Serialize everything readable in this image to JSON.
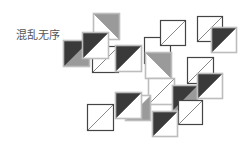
{
  "label": "混乱无序",
  "colors": {
    "dark": "#3a3a3a",
    "gray": "#9a9a9a",
    "outline": "#444444",
    "border_light": "#bdbdbd",
    "bg": "#ffffff"
  },
  "tiles": [
    {
      "x": 93,
      "y": 13,
      "s": 27,
      "fill": "gray",
      "tri": "tr",
      "line": "tlbr",
      "border": "light"
    },
    {
      "x": 144,
      "y": 37,
      "s": 27,
      "fill": "none",
      "tri": "none",
      "line": "none",
      "border": "dark"
    },
    {
      "x": 160,
      "y": 20,
      "s": 26,
      "fill": "none",
      "tri": "none",
      "line": "bltr",
      "border": "dark"
    },
    {
      "x": 197,
      "y": 16,
      "s": 26,
      "fill": "none",
      "tri": "none",
      "line": "bltr",
      "border": "dark"
    },
    {
      "x": 63,
      "y": 40,
      "s": 27,
      "fill": "dark",
      "tri": "tl",
      "line": "bltr",
      "border": "light",
      "rest": "gray"
    },
    {
      "x": 92,
      "y": 46,
      "s": 27,
      "fill": "none",
      "tri": "none",
      "line": "bltr",
      "border": "dark"
    },
    {
      "x": 82,
      "y": 32,
      "s": 27,
      "fill": "dark",
      "tri": "tl",
      "line": "bltr",
      "border": "light"
    },
    {
      "x": 115,
      "y": 45,
      "s": 27,
      "fill": "dark",
      "tri": "tl",
      "line": "bltr",
      "border": "light"
    },
    {
      "x": 145,
      "y": 52,
      "s": 27,
      "fill": "gray",
      "tri": "tl_down",
      "line": "tlbr",
      "border": "light"
    },
    {
      "x": 211,
      "y": 27,
      "s": 26,
      "fill": "dark",
      "tri": "tl",
      "line": "bltr",
      "border": "light"
    },
    {
      "x": 187,
      "y": 57,
      "s": 27,
      "fill": "none",
      "tri": "none",
      "line": "bltr",
      "border": "dark"
    },
    {
      "x": 148,
      "y": 78,
      "s": 27,
      "fill": "none",
      "tri": "none",
      "line": "bltr",
      "border": "light"
    },
    {
      "x": 172,
      "y": 85,
      "s": 26,
      "fill": "dark",
      "tri": "tl",
      "line": "bltr",
      "border": "light",
      "rest": "gray"
    },
    {
      "x": 197,
      "y": 73,
      "s": 26,
      "fill": "dark",
      "tri": "tl",
      "line": "bltr",
      "border": "light"
    },
    {
      "x": 178,
      "y": 100,
      "s": 25,
      "fill": "none",
      "tri": "none",
      "line": "bltr",
      "border": "dark"
    },
    {
      "x": 125,
      "y": 95,
      "s": 26,
      "fill": "gray",
      "tri": "br",
      "line": "none",
      "border": "light"
    },
    {
      "x": 87,
      "y": 104,
      "s": 27,
      "fill": "none",
      "tri": "none",
      "line": "bltr",
      "border": "dark"
    },
    {
      "x": 115,
      "y": 92,
      "s": 27,
      "fill": "dark",
      "tri": "tl",
      "line": "bltr",
      "border": "light"
    },
    {
      "x": 152,
      "y": 111,
      "s": 26,
      "fill": "dark",
      "tri": "tl",
      "line": "bltr",
      "border": "light"
    }
  ]
}
